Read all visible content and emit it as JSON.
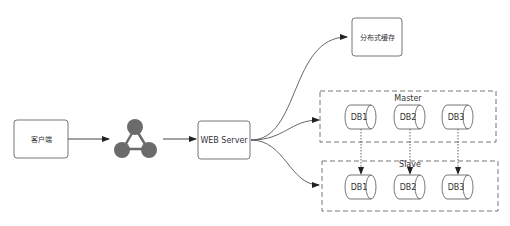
{
  "nodes": {
    "client": {
      "label": "客户端"
    },
    "load_balancer": {
      "icon": "load-balancer-icon"
    },
    "web_server": {
      "label": "WEB Server"
    },
    "cache": {
      "label": "分布式缓存"
    },
    "master_group": {
      "label": "Master",
      "dbs": [
        "DB1",
        "DB2",
        "DB3"
      ]
    },
    "slave_group": {
      "label": "Slave",
      "dbs": [
        "DB1",
        "DB2",
        "DB3"
      ]
    }
  },
  "colors": {
    "stroke": "#555555",
    "node_fill": "#6b6b6b",
    "text": "#333333"
  }
}
